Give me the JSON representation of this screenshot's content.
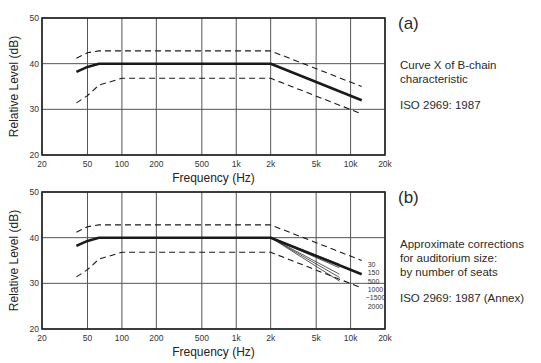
{
  "chart_data": [
    {
      "type": "line",
      "panel": "(a)",
      "title": "Curve X of B-chain characteristic",
      "subtitle": "ISO 2969: 1987",
      "xlabel": "Frequency (Hz)",
      "ylabel": "Relative Level (dB)",
      "xscale": "log",
      "xlim": [
        20,
        20000
      ],
      "ylim": [
        20,
        50
      ],
      "xticks": [
        20,
        50,
        100,
        200,
        500,
        1000,
        2000,
        5000,
        10000,
        20000
      ],
      "xtick_labels": [
        "20",
        "50",
        "100",
        "200",
        "500",
        "1k",
        "2k",
        "5k",
        "10k",
        "20k"
      ],
      "yticks": [
        20,
        30,
        40,
        50
      ],
      "ytick_labels": [
        "20",
        "30",
        "40",
        "50"
      ],
      "grid": true,
      "series": [
        {
          "name": "Curve X (nominal)",
          "style": "solid",
          "x": [
            40,
            50,
            63,
            2000,
            12500
          ],
          "y": [
            38.2,
            39.3,
            40,
            40,
            32
          ]
        },
        {
          "name": "Upper tolerance",
          "style": "dashed",
          "x": [
            40,
            50,
            63,
            2000,
            12500
          ],
          "y": [
            41.2,
            42.4,
            42.8,
            42.8,
            35
          ]
        },
        {
          "name": "Lower tolerance",
          "style": "dashed",
          "x": [
            40,
            50,
            63,
            100,
            2000,
            12500
          ],
          "y": [
            31.4,
            33,
            35.3,
            36.8,
            36.8,
            29
          ]
        }
      ]
    },
    {
      "type": "line",
      "panel": "(b)",
      "title": "Approximate corrections for auditorium size: by number of seats",
      "subtitle": "ISO 2969: 1987 (Annex)",
      "xlabel": "Frequency (Hz)",
      "ylabel": "Relative Level (dB)",
      "xscale": "log",
      "xlim": [
        20,
        20000
      ],
      "ylim": [
        20,
        50
      ],
      "xticks": [
        20,
        50,
        100,
        200,
        500,
        1000,
        2000,
        5000,
        10000,
        20000
      ],
      "xtick_labels": [
        "20",
        "50",
        "100",
        "200",
        "500",
        "1k",
        "2k",
        "5k",
        "10k",
        "20k"
      ],
      "yticks": [
        20,
        30,
        40,
        50
      ],
      "ytick_labels": [
        "20",
        "30",
        "40",
        "50"
      ],
      "grid": true,
      "series": [
        {
          "name": "Curve X (nominal)",
          "style": "solid",
          "x": [
            40,
            50,
            63,
            2000,
            12500
          ],
          "y": [
            38.2,
            39.3,
            40,
            40,
            32
          ]
        },
        {
          "name": "Upper tolerance",
          "style": "dashed",
          "x": [
            40,
            50,
            63,
            2000,
            12500
          ],
          "y": [
            41.2,
            42.4,
            42.8,
            42.8,
            35
          ]
        },
        {
          "name": "Lower tolerance",
          "style": "dashed",
          "x": [
            40,
            50,
            63,
            100,
            2000,
            12500
          ],
          "y": [
            31.4,
            33,
            35.3,
            36.8,
            36.8,
            29
          ]
        }
      ],
      "seat_corrections": [
        {
          "seats": "30",
          "x": [
            2000,
            8000
          ],
          "y": [
            40,
            34.2
          ]
        },
        {
          "seats": "150",
          "x": [
            2000,
            8000
          ],
          "y": [
            40,
            33.4
          ]
        },
        {
          "seats": "500",
          "x": [
            2000,
            12500
          ],
          "y": [
            40,
            32
          ]
        },
        {
          "seats": "1000",
          "x": [
            2000,
            8000
          ],
          "y": [
            40,
            32.0
          ]
        },
        {
          "seats": "1500",
          "x": [
            2000,
            8000
          ],
          "y": [
            40,
            31.3
          ]
        },
        {
          "seats": "2000",
          "x": [
            2000,
            8000
          ],
          "y": [
            40,
            30.5
          ]
        }
      ],
      "seat_labels": [
        "30",
        "150",
        "500",
        "1000",
        "~1500",
        "2000"
      ]
    }
  ],
  "panels": {
    "a": {
      "label": "(a)",
      "lines": [
        "Curve X of B-chain",
        "characteristic"
      ],
      "standard": "ISO 2969: 1987"
    },
    "b": {
      "label": "(b)",
      "lines": [
        "Approximate corrections",
        "for auditorium size:",
        "by number of seats"
      ],
      "standard": "ISO 2969: 1987 (Annex)"
    }
  }
}
